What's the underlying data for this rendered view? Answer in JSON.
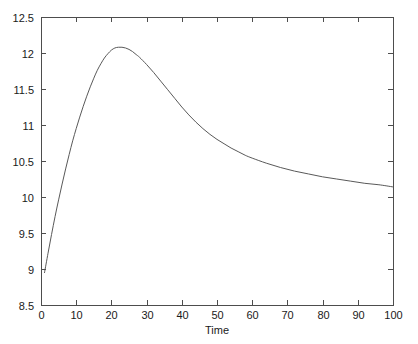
{
  "figure": {
    "background_color": "#ffffff",
    "axis_color": "#4d4d4d",
    "line_color": "#595959",
    "text_color": "#1a1a1a",
    "plot_box": {
      "left": 41,
      "top": 17,
      "right": 393,
      "bottom": 305
    }
  },
  "chart_data": {
    "type": "line",
    "title": "",
    "subtitle": "",
    "xlabel": "Time",
    "ylabel": "",
    "xlim": [
      0,
      100
    ],
    "ylim": [
      8.5,
      12.5
    ],
    "xticks": [
      0,
      10,
      20,
      30,
      40,
      50,
      60,
      70,
      80,
      90,
      100
    ],
    "xticklabels": [
      "0",
      "10",
      "20",
      "30",
      "40",
      "50",
      "60",
      "70",
      "80",
      "90",
      "100"
    ],
    "yticks": [
      8.5,
      9,
      9.5,
      10,
      10.5,
      11,
      11.5,
      12,
      12.5
    ],
    "yticklabels": [
      "8.5",
      "9",
      "9.5",
      "10",
      "10.5",
      "11",
      "11.5",
      "12",
      "12.5"
    ],
    "grid": false,
    "legend": null,
    "annotations": [],
    "series": [
      {
        "name": "response",
        "color": "#595959",
        "linewidth": 1,
        "x": [
          1,
          2,
          3,
          4,
          5,
          6,
          7,
          8,
          9,
          10,
          11,
          12,
          13,
          14,
          15,
          16,
          17,
          18,
          19,
          20,
          21,
          22,
          23,
          24,
          25,
          26,
          27,
          28,
          30,
          32,
          34,
          36,
          38,
          40,
          42,
          44,
          46,
          48,
          50,
          52,
          54,
          56,
          58,
          60,
          64,
          68,
          72,
          76,
          80,
          84,
          88,
          92,
          96,
          100
        ],
        "y": [
          8.95,
          9.22,
          9.48,
          9.73,
          9.96,
          10.18,
          10.39,
          10.59,
          10.78,
          10.95,
          11.11,
          11.26,
          11.4,
          11.53,
          11.65,
          11.76,
          11.85,
          11.93,
          11.99,
          12.04,
          12.07,
          12.08,
          12.08,
          12.07,
          12.05,
          12.02,
          11.98,
          11.94,
          11.84,
          11.73,
          11.61,
          11.49,
          11.37,
          11.25,
          11.14,
          11.04,
          10.95,
          10.87,
          10.8,
          10.74,
          10.68,
          10.63,
          10.58,
          10.54,
          10.47,
          10.41,
          10.36,
          10.32,
          10.28,
          10.25,
          10.22,
          10.19,
          10.17,
          10.14
        ]
      }
    ],
    "peak": {
      "x": 23,
      "y": 12.08
    },
    "start": {
      "x": 1,
      "y": 8.95
    },
    "end": {
      "x": 100,
      "y": 10.14
    }
  }
}
